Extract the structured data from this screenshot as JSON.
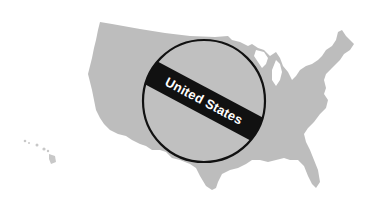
{
  "map": {
    "region": "United States",
    "fill_color": "#bdbdbd",
    "background_color": "#ffffff"
  },
  "emblem": {
    "label": "United States",
    "circle_stroke_color": "#111111",
    "band_color": "#111111",
    "label_color": "#ffffff"
  }
}
